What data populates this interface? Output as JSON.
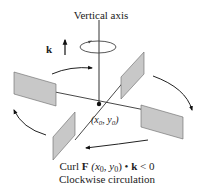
{
  "diagram": {
    "axis_label": "Vertical axis",
    "k_label": "k",
    "point_label_x": "(x",
    "point_label_sub0": "0",
    "point_label_mid": ", y",
    "point_label_sub1": "0",
    "point_label_end": ")",
    "caption_line1_curl": "Curl ",
    "caption_line1_F": "F",
    "caption_line1_args_a": " (x",
    "caption_line1_args_sub0": "0",
    "caption_line1_args_b": ", y",
    "caption_line1_args_sub1": "0",
    "caption_line1_args_c": ") • ",
    "caption_line1_k": "k",
    "caption_line1_rel": " < 0",
    "caption_line2": "Clockwise circulation",
    "colors": {
      "panel_fill": "#c8c8c8",
      "panel_stroke": "#555555",
      "line": "#222222",
      "arrow": "#111111"
    }
  }
}
